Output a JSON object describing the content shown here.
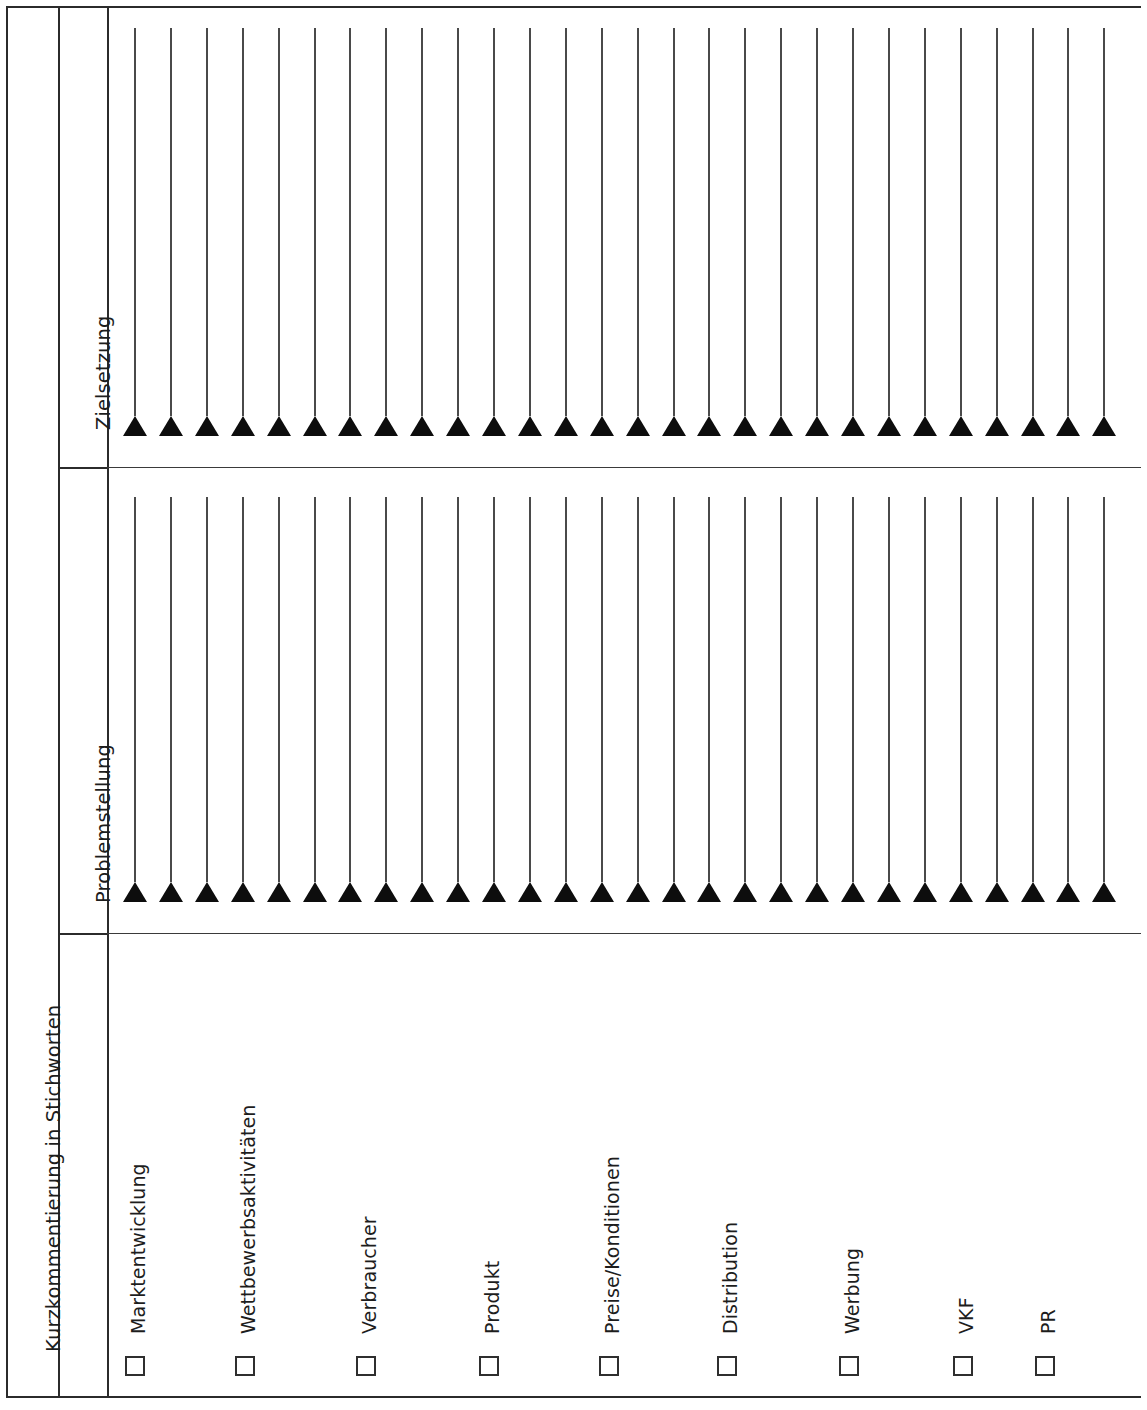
{
  "form": {
    "side_title": "Kurzkommentierung in Stichworten",
    "column_headers": [
      {
        "id": "zielsetzung",
        "label": "Zielsetzung"
      },
      {
        "id": "problemstellung",
        "label": "Problemstellung"
      }
    ],
    "row_categories": [
      {
        "id": "marktentwicklung",
        "label": "Marktentwicklung",
        "checked": false
      },
      {
        "id": "wettbewerbsaktivitaeten",
        "label": "Wettbewerbsaktivitäten",
        "checked": false
      },
      {
        "id": "verbraucher",
        "label": "Verbraucher",
        "checked": false
      },
      {
        "id": "produkt",
        "label": "Produkt",
        "checked": false
      },
      {
        "id": "preise-konditionen",
        "label": "Preise/Konditionen",
        "checked": false
      },
      {
        "id": "distribution",
        "label": "Distribution",
        "checked": false
      },
      {
        "id": "werbung",
        "label": "Werbung",
        "checked": false
      },
      {
        "id": "vkf",
        "label": "VKF",
        "checked": false
      },
      {
        "id": "pr",
        "label": "PR",
        "checked": false
      }
    ],
    "writing_rows": {
      "count_per_section": 28,
      "marker": "filled-triangle",
      "line_style": "solid",
      "sections": [
        {
          "id": "zielsetzung",
          "entries": [
            "",
            "",
            "",
            "",
            "",
            "",
            "",
            "",
            "",
            "",
            "",
            "",
            "",
            "",
            "",
            "",
            "",
            "",
            "",
            "",
            "",
            "",
            "",
            "",
            "",
            "",
            "",
            ""
          ]
        },
        {
          "id": "problemstellung",
          "entries": [
            "",
            "",
            "",
            "",
            "",
            "",
            "",
            "",
            "",
            "",
            "",
            "",
            "",
            "",
            "",
            "",
            "",
            "",
            "",
            "",
            "",
            "",
            "",
            "",
            "",
            "",
            "",
            ""
          ]
        }
      ]
    },
    "colors": {
      "border": "#2b2b2b",
      "rule": "#4a4a4a",
      "marker": "#0d0d0d",
      "text": "#1d1d1d",
      "background": "#ffffff"
    }
  }
}
